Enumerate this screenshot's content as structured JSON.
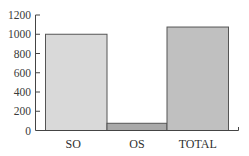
{
  "chart_data": {
    "type": "bar",
    "title": "",
    "xlabel": "",
    "ylabel": "",
    "categories": [
      "SO",
      "OS",
      "TOTAL"
    ],
    "values": [
      1000,
      75,
      1075
    ],
    "colors": [
      "#d9d9d9",
      "#a9a9a9",
      "#c0c0c0"
    ],
    "border_color": "#555555",
    "ylim": [
      0,
      1200
    ],
    "yticks": [
      0,
      200,
      400,
      600,
      800,
      1000,
      1200
    ],
    "grid": false,
    "legend": null
  }
}
